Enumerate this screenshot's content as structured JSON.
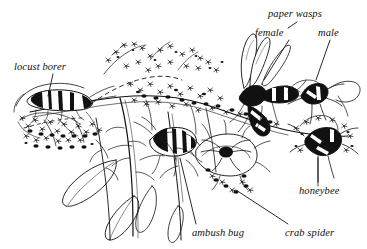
{
  "figure": {
    "medium": "pen-and-ink line drawing",
    "background_color": "#ffffff",
    "ink_color": "#111111",
    "width": 367,
    "height": 249
  },
  "labels": {
    "locust_borer": "locust borer",
    "paper_wasps": "paper wasps",
    "female": "female",
    "male": "male",
    "honeybee": "honeybee",
    "ambush_bug": "ambush bug",
    "crab_spider": "crab spider"
  },
  "subjects": [
    {
      "name": "locust borer",
      "position": "upper left, on flower spray"
    },
    {
      "name": "paper wasp female",
      "position": "upper right, in flight with long wings"
    },
    {
      "name": "paper wasp male",
      "position": "right, on flower head"
    },
    {
      "name": "honeybee",
      "position": "lower right, on flower stem"
    },
    {
      "name": "ambush bug",
      "position": "center, striped body on flower"
    },
    {
      "name": "crab spider",
      "position": "lower center-right, on dark flower cluster"
    }
  ],
  "plant": {
    "name": "goldenrod",
    "features": [
      "arching flower sprays",
      "lance-shaped leaves",
      "upright stems"
    ]
  }
}
